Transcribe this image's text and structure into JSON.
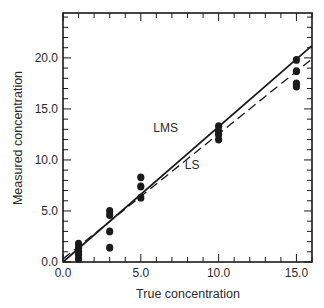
{
  "chart_data": {
    "type": "scatter",
    "title": "",
    "xlabel": "True concentration",
    "ylabel": "Measured concentration",
    "xlim": [
      0,
      16
    ],
    "ylim": [
      0,
      24.4
    ],
    "grid": false,
    "legend": "none (inline line labels)",
    "x_ticks": [
      0.0,
      5.0,
      10.0,
      15.0
    ],
    "x_tick_labels": [
      "0.0",
      "5.0",
      "10.0",
      "15.0"
    ],
    "y_ticks": [
      0.0,
      5.0,
      10.0,
      15.0,
      20.0
    ],
    "y_tick_labels": [
      "0.0",
      "5.0",
      "10.0",
      "15.0",
      "20.0"
    ],
    "points": [
      {
        "x": 1,
        "y": 1.8
      },
      {
        "x": 1,
        "y": 1.4
      },
      {
        "x": 1,
        "y": 1.0
      },
      {
        "x": 1,
        "y": 0.7
      },
      {
        "x": 1,
        "y": 0.3
      },
      {
        "x": 3,
        "y": 5.0
      },
      {
        "x": 3,
        "y": 4.6
      },
      {
        "x": 3,
        "y": 3.0
      },
      {
        "x": 3,
        "y": 1.4
      },
      {
        "x": 5,
        "y": 8.3
      },
      {
        "x": 5,
        "y": 7.4
      },
      {
        "x": 5,
        "y": 6.3
      },
      {
        "x": 10,
        "y": 13.3
      },
      {
        "x": 10,
        "y": 12.8
      },
      {
        "x": 10,
        "y": 12.5
      },
      {
        "x": 10,
        "y": 12.0
      },
      {
        "x": 15,
        "y": 19.8
      },
      {
        "x": 15,
        "y": 18.7
      },
      {
        "x": 15,
        "y": 17.5
      },
      {
        "x": 15,
        "y": 17.2
      }
    ],
    "series": [
      {
        "name": "LMS",
        "style": "solid",
        "x": [
          0,
          16
        ],
        "y": [
          0.0,
          21.2
        ]
      },
      {
        "name": "LS",
        "style": "dashed",
        "x": [
          0,
          16
        ],
        "y": [
          0.3,
          19.9
        ]
      }
    ],
    "annotations": [
      {
        "text": "LMS",
        "x": 6.6,
        "y": 12.7
      },
      {
        "text": "LS",
        "x": 8.3,
        "y": 9.1
      }
    ]
  },
  "colors": {
    "ink": "#1a1a1a",
    "background": "#ffffff"
  }
}
